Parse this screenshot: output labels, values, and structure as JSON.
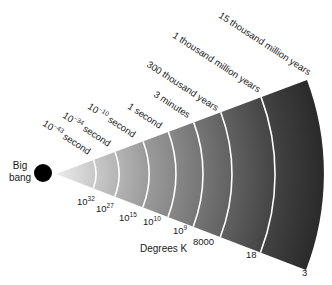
{
  "diagram": {
    "origin_label": [
      "Big",
      "bang"
    ],
    "axis_label": "Degrees K",
    "colors": {
      "apex": "#e6e6e6",
      "outer": "#2a2a2a",
      "dot": "#000000",
      "arc_line": "#ffffff",
      "text": "#1a1a1a"
    },
    "epochs": [
      {
        "time_base": "10",
        "time_exp": "−43",
        "time_unit": "second",
        "temp_base": "10",
        "temp_exp": "32"
      },
      {
        "time_base": "10",
        "time_exp": "−34",
        "time_unit": "second",
        "temp_base": "10",
        "temp_exp": "27"
      },
      {
        "time_base": "10",
        "time_exp": "−10",
        "time_unit": "second",
        "temp_base": "10",
        "temp_exp": "15"
      },
      {
        "time_base": "",
        "time_exp": "",
        "time_unit": "1 second",
        "temp_base": "10",
        "temp_exp": "10"
      },
      {
        "time_base": "",
        "time_exp": "",
        "time_unit": "3 minutes",
        "temp_base": "10",
        "temp_exp": "9"
      },
      {
        "time_base": "",
        "time_exp": "",
        "time_unit": "300 thousand years",
        "temp_base": "8000",
        "temp_exp": ""
      },
      {
        "time_base": "",
        "time_exp": "",
        "time_unit": "1 thousand million years",
        "temp_base": "18",
        "temp_exp": ""
      },
      {
        "time_base": "",
        "time_exp": "",
        "time_unit": "15 thousand million years",
        "temp_base": "3",
        "temp_exp": ""
      }
    ]
  }
}
